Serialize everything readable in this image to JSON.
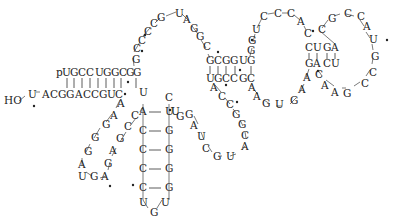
{
  "diagram": {
    "type": "rna-secondary-structure",
    "labels": {
      "five_prime": "p",
      "three_prime": "HO"
    },
    "acceptor_stem": {
      "top_strand": [
        "U",
        "G",
        "C",
        "C",
        "U",
        "G",
        "G",
        "C",
        "G"
      ],
      "bottom_strand": [
        "U",
        "A",
        "C",
        "G",
        "G",
        "A",
        "C",
        "C",
        "G",
        "U",
        "C"
      ],
      "pairs": 9
    },
    "nucleotides": [
      {
        "id": "t0",
        "b": "p",
        "x": 67,
        "y": 73
      },
      {
        "id": "t1",
        "b": "U",
        "x": 78,
        "y": 73
      },
      {
        "id": "t2",
        "b": "G",
        "x": 87,
        "y": 73
      },
      {
        "id": "t3",
        "b": "C",
        "x": 96,
        "y": 73
      },
      {
        "id": "t4",
        "b": "C",
        "x": 106,
        "y": 73
      },
      {
        "id": "t5",
        "b": "U",
        "x": 115,
        "y": 73
      },
      {
        "id": "t6",
        "b": "G",
        "x": 124,
        "y": 73
      },
      {
        "id": "t7",
        "b": "G",
        "x": 133,
        "y": 73
      },
      {
        "id": "t8",
        "b": "C",
        "x": 141,
        "y": 73
      },
      {
        "id": "t9",
        "b": "G",
        "x": 149,
        "y": 73
      },
      {
        "id": "g1",
        "b": "G",
        "x": 153,
        "y": 60
      },
      {
        "id": "g2",
        "b": "C",
        "x": 154,
        "y": 47
      },
      {
        "id": "l1",
        "b": "C",
        "x": 159,
        "y": 38
      },
      {
        "id": "l2",
        "b": "C",
        "x": 165,
        "y": 29
      },
      {
        "id": "l3",
        "b": "G",
        "x": 178,
        "y": 19
      },
      {
        "id": "l4",
        "b": "U",
        "x": 197,
        "y": 14
      },
      {
        "id": "l5",
        "b": "A",
        "x": 215,
        "y": 22
      },
      {
        "id": "l6",
        "b": "G",
        "x": 224,
        "y": 37
      },
      {
        "id": "l7",
        "b": "C",
        "x": 231,
        "y": 49
      },
      {
        "id": "d1",
        "b": "G",
        "x": 237,
        "y": 63
      },
      {
        "id": "d2",
        "b": "C",
        "x": 245,
        "y": 63
      },
      {
        "id": "d3",
        "b": "G",
        "x": 254,
        "y": 63
      },
      {
        "id": "d4",
        "b": "G",
        "x": 263,
        "y": 63
      },
      {
        "id": "d5",
        "b": "U",
        "x": 272,
        "y": 63
      },
      {
        "id": "d6",
        "b": "G",
        "x": 282,
        "y": 63
      },
      {
        "id": "e1",
        "b": "G",
        "x": 283,
        "y": 47
      },
      {
        "id": "e2",
        "b": "U",
        "x": 285,
        "y": 30
      },
      {
        "id": "e3",
        "b": "C",
        "x": 295,
        "y": 15
      },
      {
        "id": "e4",
        "b": "C",
        "x": 312,
        "y": 15
      },
      {
        "id": "e5",
        "b": "C",
        "x": 327,
        "y": 20
      },
      {
        "id": "e6",
        "b": "A",
        "x": 339,
        "y": 30
      },
      {
        "id": "e7",
        "b": "C",
        "x": 345,
        "y": 39
      },
      {
        "id": "f1",
        "b": "C",
        "x": 344,
        "y": 53
      },
      {
        "id": "f2",
        "b": "U",
        "x": 353,
        "y": 53
      },
      {
        "id": "f3",
        "b": "G",
        "x": 364,
        "y": 53
      },
      {
        "id": "f4",
        "b": "A",
        "x": 372,
        "y": 53
      },
      {
        "id": "h1",
        "b": "C",
        "x": 319,
        "y": 32
      },
      {
        "id": "h2",
        "b": "G",
        "x": 328,
        "y": 20
      },
      {
        "id": "h3",
        "b": "C",
        "x": 345,
        "y": 14
      },
      {
        "id": "h4",
        "b": "C",
        "x": 361,
        "y": 14
      },
      {
        "id": "h5",
        "b": "A",
        "x": 372,
        "y": 25
      },
      {
        "id": "h6",
        "b": "U",
        "x": 378,
        "y": 39
      },
      {
        "id": "h7",
        "b": "G",
        "x": 381,
        "y": 57
      },
      {
        "id": "h8",
        "b": "C",
        "x": 379,
        "y": 76
      },
      {
        "id": "h9",
        "b": "C",
        "x": 371,
        "y": 88
      },
      {
        "id": "h10",
        "b": "G",
        "x": 355,
        "y": 97
      },
      {
        "id": "h11",
        "b": "A",
        "x": 339,
        "y": 97
      },
      {
        "id": "h12",
        "b": "A",
        "x": 327,
        "y": 90
      },
      {
        "id": "h13",
        "b": "C",
        "x": 319,
        "y": 78
      },
      {
        "id": "f5",
        "b": "U",
        "x": 372,
        "y": 66
      },
      {
        "id": "f6",
        "b": "C",
        "x": 364,
        "y": 66
      },
      {
        "id": "f7",
        "b": "A",
        "x": 353,
        "y": 66
      },
      {
        "id": "f8",
        "b": "G",
        "x": 344,
        "y": 66
      },
      {
        "id": "k1",
        "b": "A",
        "x": 341,
        "y": 79
      },
      {
        "id": "k2",
        "b": "A",
        "x": 336,
        "y": 91
      },
      {
        "id": "k3",
        "b": "G",
        "x": 324,
        "y": 103
      },
      {
        "id": "k4",
        "b": "U",
        "x": 309,
        "y": 105
      },
      {
        "id": "k5",
        "b": "G",
        "x": 295,
        "y": 105
      },
      {
        "id": "k6",
        "b": "A",
        "x": 286,
        "y": 98
      },
      {
        "id": "k7",
        "b": "A",
        "x": 280,
        "y": 88
      },
      {
        "id": "k8",
        "b": "C",
        "x": 277,
        "y": 76
      },
      {
        "id": "d7",
        "b": "C",
        "x": 263,
        "y": 76
      },
      {
        "id": "d8",
        "b": "C",
        "x": 254,
        "y": 76
      },
      {
        "id": "d9",
        "b": "G",
        "x": 245,
        "y": 76
      },
      {
        "id": "d10",
        "b": "U",
        "x": 237,
        "y": 76
      },
      {
        "id": "m1",
        "b": "A",
        "x": 244,
        "y": 89
      },
      {
        "id": "m2",
        "b": "C",
        "x": 254,
        "y": 100
      },
      {
        "id": "m3",
        "b": "C",
        "x": 263,
        "y": 110
      },
      {
        "id": "m4",
        "b": "G",
        "x": 270,
        "y": 121
      },
      {
        "id": "m5",
        "b": "G",
        "x": 276,
        "y": 131
      },
      {
        "id": "m6",
        "b": "C",
        "x": 281,
        "y": 144
      },
      {
        "id": "m7",
        "b": "C",
        "x": 274,
        "y": 155
      },
      {
        "id": "m8",
        "b": "G",
        "x": 272,
        "y": 171
      },
      {
        "id": "m9",
        "b": "A",
        "x": 240,
        "y": 184
      },
      {
        "id": "m10",
        "b": "U",
        "x": 229,
        "y": 195
      },
      {
        "id": "m11",
        "b": "G",
        "x": 216,
        "y": 195
      },
      {
        "id": "m12",
        "b": "C",
        "x": 206,
        "y": 185
      },
      {
        "id": "m13",
        "b": "U",
        "x": 197,
        "y": 171
      },
      {
        "id": "m14",
        "b": "A",
        "x": 191,
        "y": 157
      },
      {
        "id": "m15",
        "b": "G",
        "x": 186,
        "y": 143
      },
      {
        "id": "a1",
        "b": "C",
        "x": 157,
        "y": 84
      },
      {
        "id": "a2",
        "b": "A",
        "x": 156,
        "y": 97
      },
      {
        "id": "a3",
        "b": "A",
        "x": 144,
        "y": 110
      },
      {
        "id": "a4",
        "b": "G",
        "x": 134,
        "y": 122
      },
      {
        "id": "a5",
        "b": "G",
        "x": 127,
        "y": 135
      },
      {
        "id": "a6",
        "b": "G",
        "x": 123,
        "y": 150
      },
      {
        "id": "a7",
        "b": "A",
        "x": 119,
        "y": 163
      },
      {
        "id": "a8",
        "b": "U",
        "x": 122,
        "y": 176
      },
      {
        "id": "a9",
        "b": "G",
        "x": 135,
        "y": 181
      },
      {
        "id": "a10",
        "b": "A",
        "x": 147,
        "y": 178
      },
      {
        "id": "a11",
        "b": "G",
        "x": 151,
        "y": 164
      },
      {
        "id": "a12",
        "b": "A",
        "x": 156,
        "y": 150
      },
      {
        "id": "a13",
        "b": "G",
        "x": 165,
        "y": 137
      },
      {
        "id": "a14",
        "b": "C",
        "x": 172,
        "y": 125
      },
      {
        "id": "a15",
        "b": "C",
        "x": 180,
        "y": 114
      },
      {
        "id": "s0",
        "b": "U",
        "x": 188,
        "y": 97
      },
      {
        "id": "s1",
        "b": "A",
        "x": 190,
        "y": 110
      },
      {
        "id": "s2",
        "b": "C",
        "x": 190,
        "y": 130
      },
      {
        "id": "s3",
        "b": "C",
        "x": 190,
        "y": 149
      },
      {
        "id": "s4",
        "b": "C",
        "x": 190,
        "y": 168
      },
      {
        "id": "s5",
        "b": "C",
        "x": 190,
        "y": 187
      },
      {
        "id": "s6",
        "b": "U",
        "x": 190,
        "y": 202
      },
      {
        "id": "s7",
        "b": "G",
        "x": 201,
        "y": 212
      },
      {
        "id": "s8",
        "b": "U",
        "x": 213,
        "y": 202
      },
      {
        "id": "s9",
        "b": "G",
        "x": 213,
        "y": 187
      },
      {
        "id": "s10",
        "b": "G",
        "x": 213,
        "y": 168
      },
      {
        "id": "s11",
        "b": "G",
        "x": 213,
        "y": 149
      },
      {
        "id": "s12",
        "b": "G",
        "x": 213,
        "y": 130
      },
      {
        "id": "s13",
        "b": "U",
        "x": 213,
        "y": 110
      },
      {
        "id": "s14",
        "b": "C",
        "x": 213,
        "y": 97
      },
      {
        "id": "s15",
        "b": "U",
        "x": 219,
        "y": 110
      },
      {
        "id": "s16",
        "b": "G",
        "x": 226,
        "y": 112
      },
      {
        "id": "b11",
        "b": "C",
        "x": 124,
        "y": 86
      },
      {
        "id": "b10",
        "b": "U",
        "x": 115,
        "y": 86
      },
      {
        "id": "b9",
        "b": "G",
        "x": 106,
        "y": 86
      },
      {
        "id": "b8",
        "b": "C",
        "x": 97,
        "y": 86
      },
      {
        "id": "b7",
        "b": "C",
        "x": 88,
        "y": 86
      },
      {
        "id": "b6",
        "b": "A",
        "x": 79,
        "y": 86
      },
      {
        "id": "b5",
        "b": "G",
        "x": 71,
        "y": 86
      },
      {
        "id": "b4",
        "b": "G",
        "x": 62,
        "y": 86
      },
      {
        "id": "b3",
        "b": "C",
        "x": 53,
        "y": 86
      },
      {
        "id": "b2",
        "b": "A",
        "x": 44,
        "y": 86
      },
      {
        "id": "b1",
        "b": "U",
        "x": 29,
        "y": 86
      }
    ]
  }
}
